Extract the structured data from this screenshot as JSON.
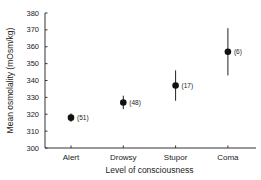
{
  "chart_data": {
    "type": "scatter",
    "title": "",
    "xlabel": "Level of consciousness",
    "ylabel": "Mean osmolality (mOsm/kg)",
    "categories": [
      "Alert",
      "Drowsy",
      "Stupor",
      "Coma"
    ],
    "ylim": [
      300,
      380
    ],
    "yticks": [
      300,
      310,
      320,
      330,
      340,
      350,
      360,
      370,
      380
    ],
    "grid": false,
    "legend": "none",
    "series": [
      {
        "name": "Mean osmolality",
        "values": [
          318,
          327,
          337,
          357
        ],
        "error": [
          2.5,
          4,
          9,
          14
        ],
        "n_labels": [
          "(51)",
          "(48)",
          "(17)",
          "(6)"
        ]
      }
    ],
    "colors": {
      "marker": "#111111",
      "axis": "#333333"
    }
  }
}
